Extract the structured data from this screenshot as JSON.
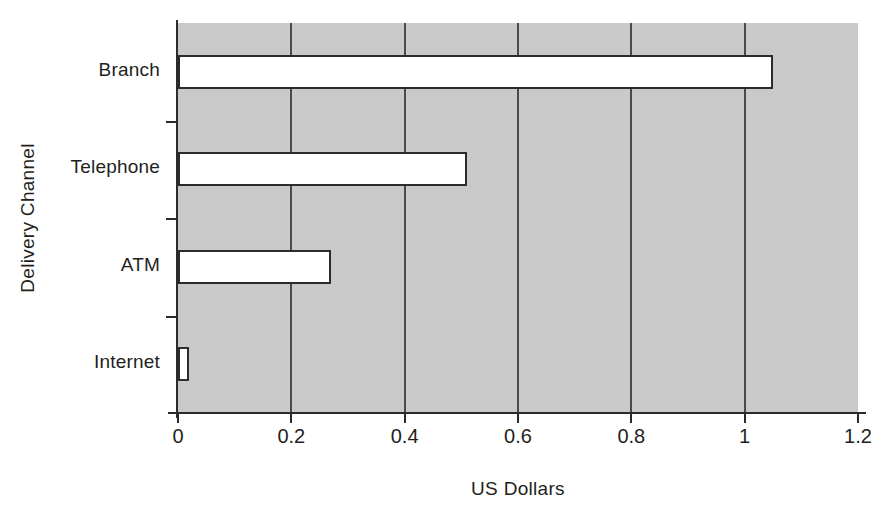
{
  "chart_data": {
    "type": "bar",
    "orientation": "horizontal",
    "title": "",
    "xlabel": "US Dollars",
    "ylabel": "Delivery Channel",
    "categories": [
      "Branch",
      "Telephone",
      "ATM",
      "Internet"
    ],
    "values": [
      1.05,
      0.51,
      0.27,
      0.02
    ],
    "xlim": [
      0,
      1.2
    ],
    "xticks": [
      0,
      0.2,
      0.4,
      0.6,
      0.8,
      1,
      1.2
    ],
    "xtick_labels": [
      "0",
      "0.2",
      "0.4",
      "0.6",
      "0.8",
      "1",
      "1.2"
    ],
    "grid": "vertical",
    "legend": "none",
    "plot_background_color": "#c9c9c9",
    "bar_fill_color": "#ffffff",
    "bar_edge_color": "#2b2b2b",
    "axis_color": "#2b2b2b",
    "text_color": "#231f20"
  }
}
